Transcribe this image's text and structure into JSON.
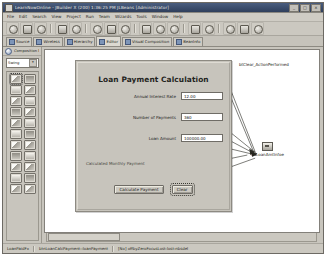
{
  "window": {
    "title": "LearnNowOnline - JBuilder X (200) 1:36:25 PM JLBeans [Administrator]",
    "icon": "app-icon",
    "controls": {
      "minimize": "_",
      "maximize": "□",
      "close": "×"
    }
  },
  "menubar": {
    "items": [
      "File",
      "Edit",
      "Search",
      "View",
      "Project",
      "Run",
      "Team",
      "Wizards",
      "Tools",
      "Window",
      "Help"
    ]
  },
  "toolbar": {
    "groups": [
      {
        "buttons": [
          {
            "name": "new-icon",
            "glyph": "N"
          },
          {
            "name": "open-icon",
            "glyph": "O"
          },
          {
            "name": "save-icon",
            "glyph": "S"
          }
        ]
      },
      {
        "buttons": [
          {
            "name": "save-all-icon",
            "glyph": "A"
          },
          {
            "name": "close-icon",
            "glyph": "C"
          }
        ]
      },
      {
        "buttons": [
          {
            "name": "undo-icon",
            "glyph": "U"
          },
          {
            "name": "redo-icon",
            "glyph": "R"
          },
          {
            "name": "cut-icon",
            "glyph": "X"
          }
        ]
      },
      {
        "buttons": [
          {
            "name": "copy-icon",
            "glyph": "P"
          },
          {
            "name": "paste-icon",
            "glyph": "V"
          },
          {
            "name": "find-icon",
            "glyph": "F"
          }
        ]
      },
      {
        "buttons": [
          {
            "name": "build-icon",
            "glyph": "B"
          },
          {
            "name": "run-icon",
            "glyph": "G"
          }
        ]
      },
      {
        "buttons": [
          {
            "name": "debug-icon",
            "glyph": "D"
          },
          {
            "name": "step-icon",
            "glyph": "T"
          },
          {
            "name": "help-icon",
            "glyph": "?"
          }
        ]
      }
    ]
  },
  "tabs": {
    "items": [
      {
        "label": "Source",
        "icon": "source-tab-icon",
        "selected": false
      },
      {
        "label": "Wireless",
        "icon": "wireless-tab-icon",
        "selected": false
      },
      {
        "label": "Hierarchy",
        "icon": "hierarchy-tab-icon",
        "selected": false
      },
      {
        "label": "Editor",
        "icon": "editor-tab-icon",
        "selected": true
      },
      {
        "label": "Visual Composition",
        "icon": "visual-tab-icon",
        "selected": false
      },
      {
        "label": "Beanlnfo",
        "icon": "beaninfo-tab-icon",
        "selected": false
      }
    ]
  },
  "palette": {
    "header": "Composition Editor",
    "header_icon": "composition-icon",
    "group_selected": "Swing",
    "dropdown_glyph": "▾",
    "tools": [
      [
        "selection-tool",
        "marquee-tool"
      ],
      [
        "jlabel-tool",
        "jbutton-tool"
      ],
      [
        "jtextfield-tool",
        "jtextarea-tool"
      ],
      [
        "jcheckbox-tool",
        "jradiobutton-tool"
      ],
      [
        "jcombobox-tool",
        "jlist-tool"
      ],
      [
        "jpanel-tool",
        "jscrollpane-tool"
      ],
      [
        "jtable-tool",
        "jtree-tool"
      ],
      [
        "jtabbedpane-tool",
        "jsplitpane-tool"
      ],
      [
        "jtoolbar-tool",
        "jmenubar-tool"
      ],
      [
        "jslider-tool",
        "jprogressbar-tool"
      ],
      [
        "jspinner-tool",
        "jseparator-tool"
      ]
    ]
  },
  "form": {
    "title": "Loan Payment Calculation",
    "fields": [
      {
        "label": "Annual Interest Rate",
        "value": "12.00",
        "name": "annual-interest-rate-field"
      },
      {
        "label": "Number of Payments",
        "value": "360",
        "name": "number-of-payments-field"
      },
      {
        "label": "Loan Amount",
        "value": "100000.00",
        "name": "loan-amount-field"
      }
    ],
    "result_label": "Calculated Monthly Payment",
    "result_value": "",
    "buttons": [
      {
        "label": "Calculate Payment",
        "name": "calculate-payment-button",
        "selected": false
      },
      {
        "label": "Clear",
        "name": "clear-button",
        "selected": true
      }
    ]
  },
  "annotations": [
    {
      "text": "btClear_ActionPerformed",
      "name": "clear-event-annotation"
    },
    {
      "text": "fldLoanAmtInfoe",
      "name": "loan-amount-event-annotation",
      "icon": "event-bean-icon"
    }
  ],
  "statusbar": {
    "items": [
      "LoanPaidFx",
      "btnLoanCalcPayment::loanPayment",
      "[No] offbyZeroFocusLost:lost:nbsdel"
    ]
  },
  "scrollbar": {
    "name": "horizontal-scrollbar"
  }
}
